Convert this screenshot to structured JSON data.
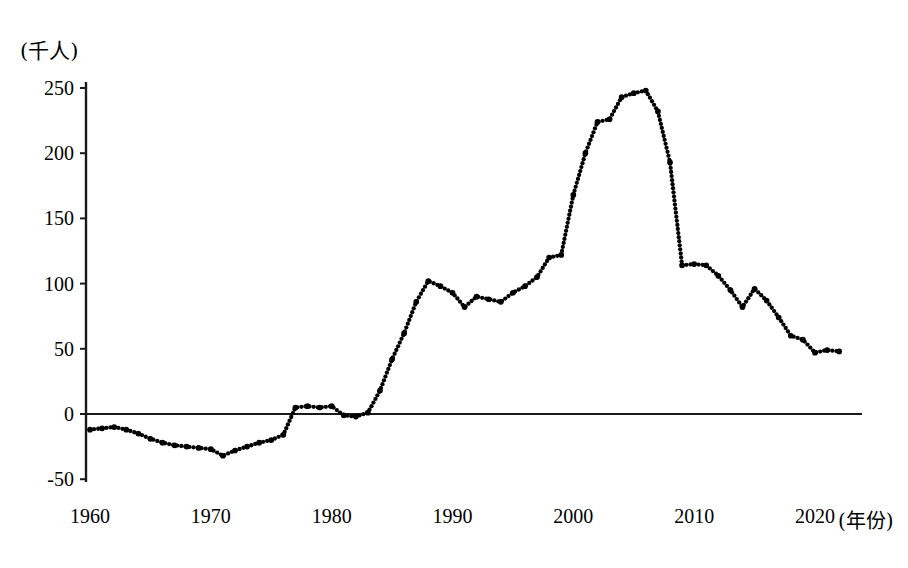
{
  "chart_data": {
    "type": "line",
    "title": "",
    "subtitle": "",
    "xlabel": "(年份)",
    "ylabel": "(千人)",
    "ylim": [
      -50,
      250
    ],
    "xlim": [
      1960,
      2022
    ],
    "grid": false,
    "legend": null,
    "zero_line": true,
    "line_style": "dotted",
    "line_color": "#000000",
    "y_ticks": [
      250,
      200,
      150,
      100,
      50,
      0,
      -50
    ],
    "y_tick_labels": [
      "250",
      "200",
      "150",
      "100",
      "50",
      "0",
      "-50"
    ],
    "x_ticks": [
      1960,
      1970,
      1980,
      1990,
      2000,
      2010,
      2020
    ],
    "x_tick_labels": [
      "1960",
      "1970",
      "1980",
      "1990",
      "2000",
      "2010",
      "2020"
    ],
    "series": [
      {
        "name": "net-migration",
        "x": [
          1960,
          1961,
          1962,
          1963,
          1964,
          1965,
          1966,
          1967,
          1968,
          1969,
          1970,
          1971,
          1972,
          1973,
          1974,
          1975,
          1976,
          1977,
          1978,
          1979,
          1980,
          1981,
          1982,
          1983,
          1984,
          1985,
          1986,
          1987,
          1988,
          1989,
          1990,
          1991,
          1992,
          1993,
          1994,
          1995,
          1996,
          1997,
          1998,
          1999,
          2000,
          2001,
          2002,
          2003,
          2004,
          2005,
          2006,
          2007,
          2008,
          2009,
          2010,
          2011,
          2012,
          2013,
          2014,
          2015,
          2016,
          2017,
          2018,
          2019,
          2020,
          2021,
          2022
        ],
        "values": [
          -12,
          -11,
          -10,
          -12,
          -15,
          -19,
          -22,
          -24,
          -25,
          -26,
          -27,
          -32,
          -28,
          -25,
          -22,
          -20,
          -16,
          5,
          6,
          5,
          6,
          -1,
          -2,
          1,
          18,
          42,
          62,
          86,
          102,
          98,
          93,
          82,
          90,
          88,
          86,
          93,
          98,
          105,
          120,
          122,
          168,
          200,
          224,
          226,
          243,
          246,
          248,
          232,
          193,
          114,
          115,
          114,
          106,
          95,
          82,
          96,
          87,
          74,
          60,
          57,
          47,
          49,
          48
        ]
      }
    ]
  },
  "axis": {
    "y_unit": "(千人)",
    "x_unit": "(年份)"
  }
}
